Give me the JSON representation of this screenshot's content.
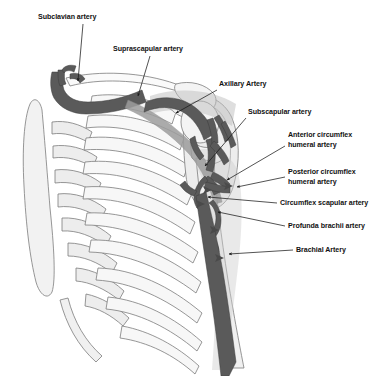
{
  "figure": {
    "background_color": "#ffffff",
    "width": 388,
    "height": 376
  },
  "palette": {
    "artery_dark": "#5a5a5a",
    "artery_outline": "#3d3d3d",
    "bone_fill": "#ffffff",
    "bone_shade": "#e4e4e4",
    "bone_shade_2": "#d2d2d2",
    "bone_outline": "#7c7c7c",
    "muscle_tint": "#bdbdbd",
    "label_color": "#111111",
    "leader_color": "#1a1a1a"
  },
  "labels": [
    {
      "id": "subclavian",
      "text": "Subclavian artery",
      "x": 38,
      "y": 13,
      "align": "left",
      "leader": {
        "x1": 83,
        "y1": 24,
        "x2": 78,
        "y2": 81
      },
      "target": "subclavian-artery"
    },
    {
      "id": "suprascapular",
      "text": "Suprascapular artery",
      "x": 113,
      "y": 45,
      "align": "left",
      "leader": {
        "x1": 150,
        "y1": 56,
        "x2": 138,
        "y2": 96
      },
      "target": "suprascapular-artery"
    },
    {
      "id": "axillary",
      "text": "Axillary Artery",
      "x": 219,
      "y": 80,
      "align": "left",
      "leader": {
        "x1": 217,
        "y1": 90,
        "x2": 176,
        "y2": 113
      },
      "target": "axillary-artery"
    },
    {
      "id": "subscapular",
      "text": "Subscapular artery",
      "x": 248,
      "y": 108,
      "align": "left",
      "leader": {
        "x1": 246,
        "y1": 118,
        "x2": 205,
        "y2": 166
      },
      "target": "subscapular-artery"
    },
    {
      "id": "anterior-circumflex",
      "text": "Anterior circumflex\nhumeral artery",
      "x": 288,
      "y": 131,
      "align": "left",
      "leader": {
        "x1": 285,
        "y1": 146,
        "x2": 227,
        "y2": 180
      },
      "target": "anterior-circumflex-humeral-artery"
    },
    {
      "id": "posterior-circumflex",
      "text": "Posterior circumflex\nhumeral artery",
      "x": 288,
      "y": 168,
      "align": "left",
      "leader": {
        "x1": 285,
        "y1": 177,
        "x2": 237,
        "y2": 187
      },
      "target": "posterior-circumflex-humeral-artery"
    },
    {
      "id": "circumflex-scapular",
      "text": "Circumflex scapular artery",
      "x": 280,
      "y": 199,
      "align": "left",
      "leader": {
        "x1": 277,
        "y1": 203,
        "x2": 208,
        "y2": 197
      },
      "target": "circumflex-scapular-artery"
    },
    {
      "id": "profunda-brachii",
      "text": "Profunda brachii artery",
      "x": 288,
      "y": 222,
      "align": "left",
      "leader": {
        "x1": 285,
        "y1": 226,
        "x2": 218,
        "y2": 212
      },
      "target": "profunda-brachii-artery"
    },
    {
      "id": "brachial",
      "text": "Brachial Artery",
      "x": 296,
      "y": 246,
      "align": "left",
      "leader": {
        "x1": 293,
        "y1": 250,
        "x2": 229,
        "y2": 254
      },
      "target": "brachial-artery"
    }
  ],
  "anatomy": {
    "bones": [
      "sternum",
      "costal-cartilages",
      "ribs",
      "clavicle",
      "scapula",
      "acromion",
      "coracoid-process",
      "humerus"
    ],
    "arteries": [
      "subclavian-artery",
      "suprascapular-artery",
      "axillary-artery",
      "subscapular-artery",
      "anterior-circumflex-humeral-artery",
      "posterior-circumflex-humeral-artery",
      "circumflex-scapular-artery",
      "profunda-brachii-artery",
      "brachial-artery"
    ],
    "rib_count": 10
  }
}
